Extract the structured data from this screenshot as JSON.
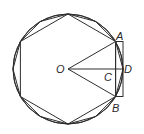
{
  "diagram": {
    "type": "geometry",
    "center": {
      "x": 68,
      "y": 69
    },
    "radius": 55,
    "labels": {
      "O": "O",
      "A": "A",
      "B": "B",
      "C": "C",
      "D": "D"
    },
    "colors": {
      "stroke": "#2e2e2e",
      "background": "#ffffff",
      "text": "#2a2a2a"
    }
  }
}
